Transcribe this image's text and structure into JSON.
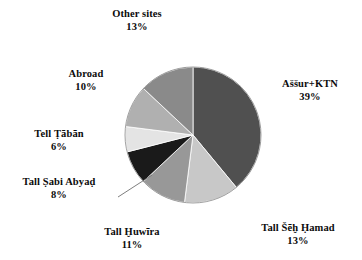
{
  "chart_data": {
    "type": "pie",
    "title": "",
    "subtitle": "",
    "xlabel": "",
    "ylabel": "",
    "legend_position": "none",
    "grid": false,
    "units": "percent",
    "start_angle_deg": 0,
    "direction": "clockwise",
    "categories": [
      "Aššur+KTN",
      "Tall Šēḫ Ḥamad",
      "Tall Ḫuwīra",
      "Tall Ṣabi Abyaḍ",
      "Tell Ṭābān",
      "Abroad",
      "Other sites"
    ],
    "values": [
      39,
      13,
      11,
      8,
      6,
      10,
      13
    ],
    "colors": [
      "#505050",
      "#c8c8c8",
      "#989898",
      "#1a1a1a",
      "#e4e4e4",
      "#b0b0b0",
      "#8a8a8a"
    ],
    "slices": [
      {
        "label": "Aššur+KTN",
        "value": 39,
        "percent_text": "39%",
        "color": "#505050"
      },
      {
        "label": "Tall Šēḫ Ḥamad",
        "value": 13,
        "percent_text": "13%",
        "color": "#c8c8c8"
      },
      {
        "label": "Tall Ḫuwīra",
        "value": 11,
        "percent_text": "11%",
        "color": "#989898"
      },
      {
        "label": "Tall Ṣabi Abyaḍ",
        "value": 8,
        "percent_text": "8%",
        "color": "#1a1a1a"
      },
      {
        "label": "Tell Ṭābān",
        "value": 6,
        "percent_text": "6%",
        "color": "#e4e4e4"
      },
      {
        "label": "Abroad",
        "value": 10,
        "percent_text": "10%",
        "color": "#b0b0b0"
      },
      {
        "label": "Other sites",
        "value": 13,
        "percent_text": "13%",
        "color": "#8a8a8a"
      }
    ]
  }
}
